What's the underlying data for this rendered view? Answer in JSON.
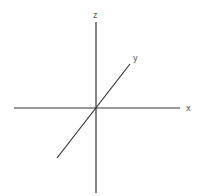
{
  "diagram": {
    "type": "3d-axes",
    "colors": {
      "axis": "#333333",
      "label": "#555555",
      "background": "#ffffff"
    },
    "axes": [
      {
        "name": "x",
        "label": "x",
        "x1": 14,
        "y1": 108,
        "x2": 180,
        "y2": 108,
        "label_x": 188,
        "label_y": 111
      },
      {
        "name": "y",
        "label": "y",
        "x1": 57,
        "y1": 158,
        "x2": 130,
        "y2": 64,
        "label_x": 135,
        "label_y": 60
      },
      {
        "name": "z",
        "label": "z",
        "x1": 96,
        "y1": 22,
        "x2": 96,
        "y2": 193,
        "label_x": 96,
        "label_y": 17
      }
    ],
    "origin": {
      "x": 96,
      "y": 108
    }
  }
}
